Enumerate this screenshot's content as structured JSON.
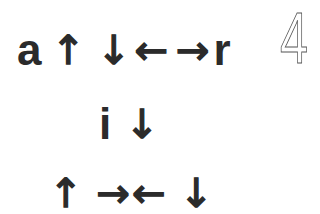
{
  "puzzle_number": "4",
  "rows": [
    {
      "glyphs": [
        "a",
        "↑",
        "↓",
        "←",
        "→",
        "r"
      ]
    },
    {
      "glyphs": [
        "i",
        "↓"
      ]
    },
    {
      "glyphs": [
        "↑",
        "→",
        "←",
        "↓"
      ]
    }
  ],
  "colors": {
    "text": "#2b2b2b",
    "background": "#ffffff"
  }
}
